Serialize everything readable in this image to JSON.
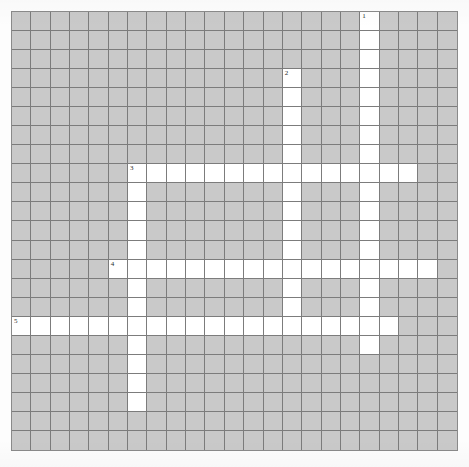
{
  "puzzle": {
    "type": "crossword-grid",
    "title": "Crossword Puzzle Grid",
    "rows": 23,
    "cols": 23,
    "cell_size_px": 19.35,
    "origin_px": {
      "x": 11,
      "y": 11
    },
    "colors": {
      "block_fill": "#c9c9c9",
      "open_fill": "#ffffff",
      "grid_line": "#7c7c7c",
      "frame_border": "#8a8a8a",
      "number_text": "#2a2a2a",
      "page_background": "#fdfdfd"
    },
    "entries": [
      {
        "number": "1",
        "direction": "down",
        "row": 0,
        "col": 18,
        "length": 18
      },
      {
        "number": "2",
        "direction": "down",
        "row": 3,
        "col": 14,
        "length": 14
      },
      {
        "number": "3",
        "direction": "across",
        "row": 8,
        "col": 6,
        "length": 15
      },
      {
        "number": "3",
        "direction": "down",
        "row": 8,
        "col": 6,
        "length": 13
      },
      {
        "number": "4",
        "direction": "across",
        "row": 13,
        "col": 5,
        "length": 17
      },
      {
        "number": "5",
        "direction": "across",
        "row": 16,
        "col": 0,
        "length": 20
      }
    ],
    "numbers": [
      {
        "label": "1",
        "row": 0,
        "col": 18
      },
      {
        "label": "2",
        "row": 3,
        "col": 14
      },
      {
        "label": "3",
        "row": 8,
        "col": 6
      },
      {
        "label": "4",
        "row": 13,
        "col": 5
      },
      {
        "label": "5",
        "row": 16,
        "col": 0
      }
    ],
    "open_cells": [
      [
        0,
        18
      ],
      [
        1,
        18
      ],
      [
        2,
        18
      ],
      [
        3,
        18
      ],
      [
        4,
        18
      ],
      [
        5,
        18
      ],
      [
        6,
        18
      ],
      [
        7,
        18
      ],
      [
        8,
        18
      ],
      [
        9,
        18
      ],
      [
        10,
        18
      ],
      [
        11,
        18
      ],
      [
        12,
        18
      ],
      [
        13,
        18
      ],
      [
        14,
        18
      ],
      [
        15,
        18
      ],
      [
        16,
        18
      ],
      [
        17,
        18
      ],
      [
        3,
        14
      ],
      [
        4,
        14
      ],
      [
        5,
        14
      ],
      [
        6,
        14
      ],
      [
        7,
        14
      ],
      [
        8,
        14
      ],
      [
        9,
        14
      ],
      [
        10,
        14
      ],
      [
        11,
        14
      ],
      [
        12,
        14
      ],
      [
        13,
        14
      ],
      [
        14,
        14
      ],
      [
        15,
        14
      ],
      [
        16,
        14
      ],
      [
        8,
        6
      ],
      [
        8,
        7
      ],
      [
        8,
        8
      ],
      [
        8,
        9
      ],
      [
        8,
        10
      ],
      [
        8,
        11
      ],
      [
        8,
        12
      ],
      [
        8,
        13
      ],
      [
        8,
        14
      ],
      [
        8,
        15
      ],
      [
        8,
        16
      ],
      [
        8,
        17
      ],
      [
        8,
        18
      ],
      [
        8,
        19
      ],
      [
        8,
        20
      ],
      [
        9,
        6
      ],
      [
        10,
        6
      ],
      [
        11,
        6
      ],
      [
        12,
        6
      ],
      [
        13,
        6
      ],
      [
        14,
        6
      ],
      [
        15,
        6
      ],
      [
        16,
        6
      ],
      [
        17,
        6
      ],
      [
        18,
        6
      ],
      [
        19,
        6
      ],
      [
        20,
        6
      ],
      [
        13,
        5
      ],
      [
        13,
        6
      ],
      [
        13,
        7
      ],
      [
        13,
        8
      ],
      [
        13,
        9
      ],
      [
        13,
        10
      ],
      [
        13,
        11
      ],
      [
        13,
        12
      ],
      [
        13,
        13
      ],
      [
        13,
        14
      ],
      [
        13,
        15
      ],
      [
        13,
        16
      ],
      [
        13,
        17
      ],
      [
        13,
        18
      ],
      [
        13,
        19
      ],
      [
        13,
        20
      ],
      [
        13,
        21
      ],
      [
        16,
        0
      ],
      [
        16,
        1
      ],
      [
        16,
        2
      ],
      [
        16,
        3
      ],
      [
        16,
        4
      ],
      [
        16,
        5
      ],
      [
        16,
        6
      ],
      [
        16,
        7
      ],
      [
        16,
        8
      ],
      [
        16,
        9
      ],
      [
        16,
        10
      ],
      [
        16,
        11
      ],
      [
        16,
        12
      ],
      [
        16,
        13
      ],
      [
        16,
        14
      ],
      [
        16,
        15
      ],
      [
        16,
        16
      ],
      [
        16,
        17
      ],
      [
        16,
        18
      ],
      [
        16,
        19
      ]
    ]
  }
}
